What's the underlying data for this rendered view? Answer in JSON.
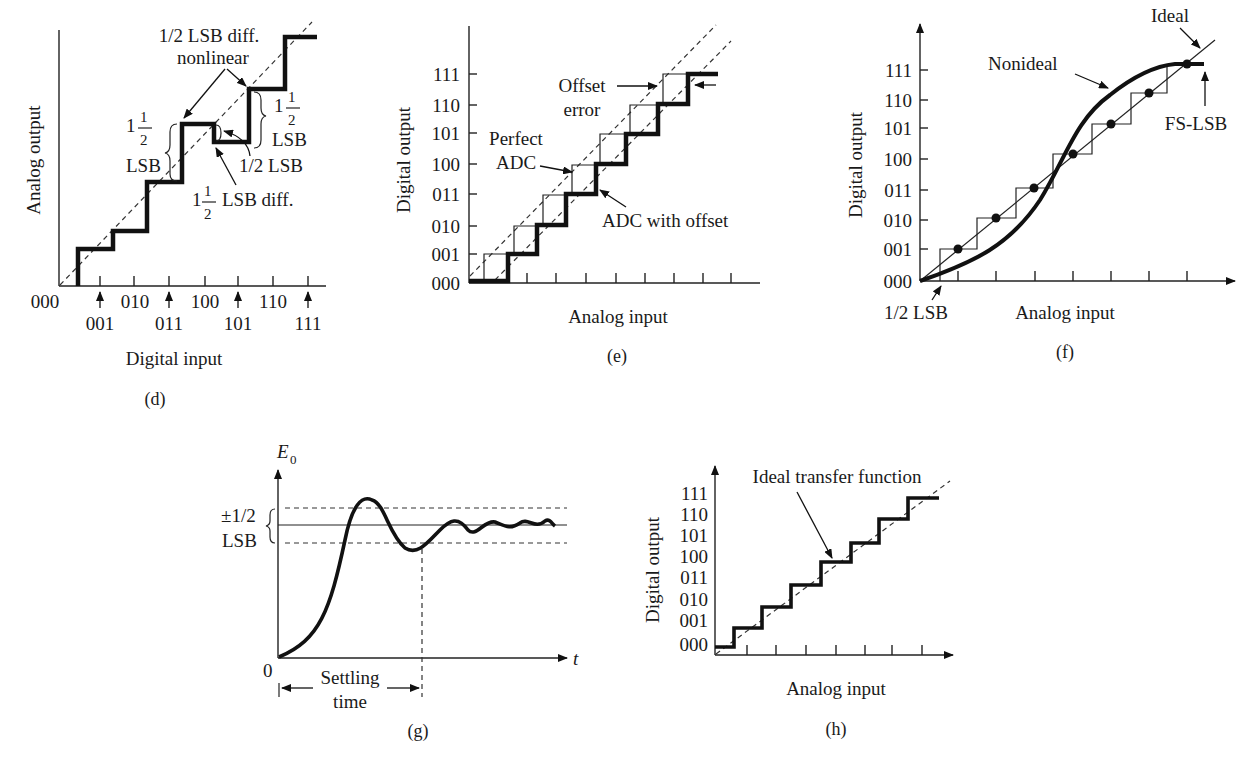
{
  "panels": {
    "d": {
      "caption": "(d)",
      "ylabel": "Analog output",
      "xlabel": "Digital input",
      "x_ticks_upper": [
        "000",
        "010",
        "100",
        "110"
      ],
      "x_ticks_lower": [
        "001",
        "011",
        "101",
        "111"
      ],
      "annotations": {
        "nonlinear_line1": "1/2 LSB diff.",
        "nonlinear_line2": "nonlinear",
        "left_whole": "1",
        "left_num": "1",
        "left_den": "2",
        "left_unit": "LSB",
        "right_whole": "1",
        "right_num": "1",
        "right_den": "2",
        "right_unit": "LSB",
        "half_lsb": "1/2 LSB",
        "diff_whole": "1",
        "diff_num": "1",
        "diff_den": "2",
        "diff_text": "LSB diff."
      }
    },
    "e": {
      "caption": "(e)",
      "ylabel": "Digital output",
      "xlabel": "Analog input",
      "y_ticks": [
        "111",
        "110",
        "101",
        "100",
        "011",
        "010",
        "001",
        "000"
      ],
      "annotations": {
        "offset_line1": "Offset",
        "offset_line2": "error",
        "perfect_line1": "Perfect",
        "perfect_line2": "ADC",
        "with_offset": "ADC with offset"
      }
    },
    "f": {
      "caption": "(f)",
      "ylabel": "Digital output",
      "xlabel": "Analog input",
      "y_ticks": [
        "111",
        "110",
        "101",
        "100",
        "011",
        "010",
        "001",
        "000"
      ],
      "annotations": {
        "ideal": "Ideal",
        "nonideal": "Nonideal",
        "fs_lsb": "FS-LSB",
        "half_lsb": "1/2 LSB"
      }
    },
    "g": {
      "caption": "(g)",
      "ylabel_main": "E",
      "ylabel_sub": "0",
      "xlabel": "t",
      "origin": "0",
      "band_line1": "±1/2",
      "band_line2": "LSB",
      "settling_line1": "Settling",
      "settling_line2": "time"
    },
    "h": {
      "caption": "(h)",
      "ylabel": "Digital output",
      "xlabel": "Analog input",
      "y_ticks": [
        "111",
        "110",
        "101",
        "100",
        "011",
        "010",
        "001",
        "000"
      ],
      "annotations": {
        "ideal_transfer": "Ideal transfer function"
      }
    }
  }
}
